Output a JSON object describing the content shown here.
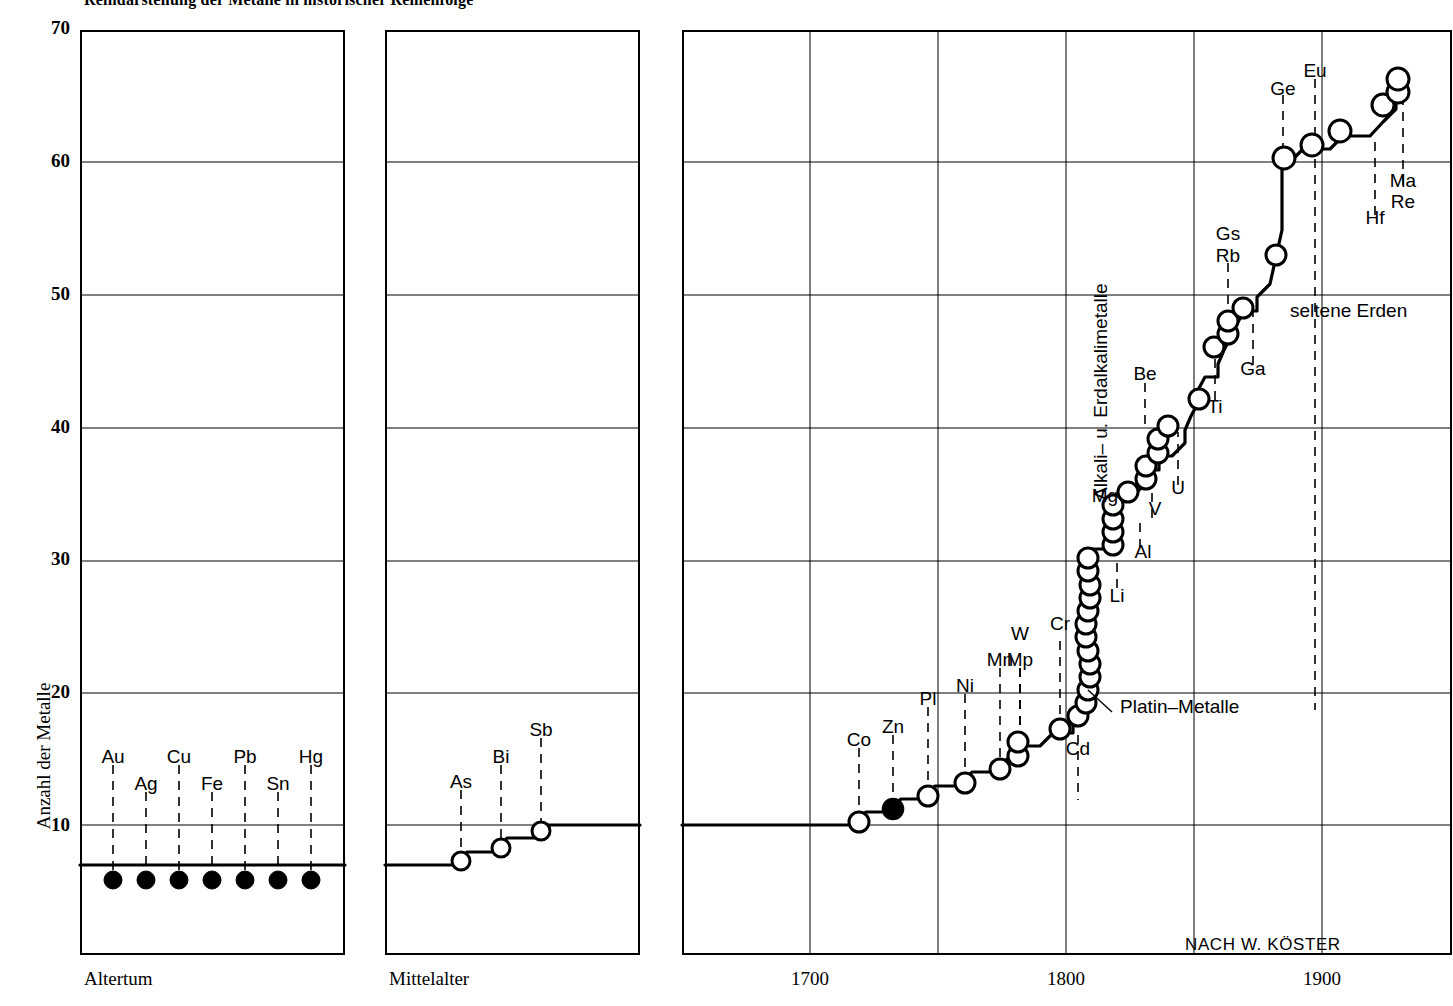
{
  "title": "Reihdarstellung der Metalle in historischer Reihenfolge",
  "credit": "NACH  W. KÖSTER",
  "axes": {
    "y_label": "Anzahl der Metalle",
    "y_ticks": [
      10,
      20,
      30,
      40,
      50,
      60,
      70
    ],
    "y_min": 0,
    "y_max": 70,
    "panel_labels": [
      "Altertum",
      "Mittelalter"
    ],
    "x_ticks": [
      1700,
      1800,
      1900
    ]
  },
  "annotations": {
    "platin": "Platin–Metalle",
    "alkali": "Alkali– u.  Erdalkalimetalle",
    "seltene": "seltene Erden"
  },
  "chart_data": {
    "type": "line",
    "title": "Reihdarstellung der Metalle in historischer Reihenfolge",
    "xlabel": "",
    "ylabel": "Anzahl der Metalle",
    "ylim": [
      0,
      70
    ],
    "grid": true,
    "legend": "none",
    "panels": [
      {
        "name": "Altertum",
        "baseline_level": 7,
        "marker": "filled",
        "points": [
          {
            "label": "Au",
            "value": 7
          },
          {
            "label": "Ag",
            "value": 7
          },
          {
            "label": "Cu",
            "value": 7
          },
          {
            "label": "Fe",
            "value": 7
          },
          {
            "label": "Pb",
            "value": 7
          },
          {
            "label": "Sn",
            "value": 7
          },
          {
            "label": "Hg",
            "value": 7
          }
        ]
      },
      {
        "name": "Mittelalter",
        "baseline_level": 7,
        "marker": "open",
        "points": [
          {
            "label": "As",
            "value": 8
          },
          {
            "label": "Bi",
            "value": 9
          },
          {
            "label": "Sb",
            "value": 10
          }
        ]
      },
      {
        "name": "Neuzeit",
        "xlim": [
          1650,
          1940
        ],
        "marker": "open",
        "points": [
          {
            "label": "Co",
            "year": 1735,
            "value": 10
          },
          {
            "label": "Zn",
            "year": 1746,
            "value": 11
          },
          {
            "label": "Pl",
            "year": 1751,
            "value": 12
          },
          {
            "label": "Ni",
            "year": 1760,
            "value": 13
          },
          {
            "label": "Mn",
            "year": 1774,
            "value": 14
          },
          {
            "label": "Mp",
            "year": 1781,
            "value": 15
          },
          {
            "label": "W",
            "year": 1783,
            "value": 16
          },
          {
            "label": "Cr",
            "year": 1797,
            "value": 17
          },
          {
            "label": "Cd",
            "year": 1802,
            "value": 18
          },
          {
            "label": "Platin-Metalle",
            "year": 1804,
            "value": 19
          },
          {
            "label": "",
            "year": 1804,
            "value": 20
          },
          {
            "label": "",
            "year": 1805,
            "value": 21
          },
          {
            "label": "",
            "year": 1805,
            "value": 22
          },
          {
            "label": "",
            "year": 1806,
            "value": 23
          },
          {
            "label": "",
            "year": 1806,
            "value": 24
          },
          {
            "label": "",
            "year": 1807,
            "value": 25
          },
          {
            "label": "",
            "year": 1807,
            "value": 26
          },
          {
            "label": "",
            "year": 1808,
            "value": 27
          },
          {
            "label": "",
            "year": 1808,
            "value": 28
          },
          {
            "label": "",
            "year": 1808,
            "value": 29
          },
          {
            "label": "",
            "year": 1808,
            "value": 30
          },
          {
            "label": "Li",
            "year": 1810,
            "value": 31
          },
          {
            "label": "Mg",
            "year": 1812,
            "value": 32
          },
          {
            "label": "Al",
            "year": 1813,
            "value": 33
          },
          {
            "label": "",
            "year": 1814,
            "value": 34
          },
          {
            "label": "",
            "year": 1817,
            "value": 35
          },
          {
            "label": "V",
            "year": 1822,
            "value": 36
          },
          {
            "label": "",
            "year": 1824,
            "value": 37
          },
          {
            "label": "Be",
            "year": 1826,
            "value": 38
          },
          {
            "label": "",
            "year": 1828,
            "value": 39
          },
          {
            "label": "U",
            "year": 1841,
            "value": 40
          },
          {
            "label": "Ti",
            "year": 1857,
            "value": 45
          },
          {
            "label": "",
            "year": 1860,
            "value": 46
          },
          {
            "label": "",
            "year": 1861,
            "value": 47
          },
          {
            "label": "Rb",
            "year": 1863,
            "value": 48
          },
          {
            "label": "Gs",
            "year": 1863,
            "value": 49
          },
          {
            "label": "Ga",
            "year": 1875,
            "value": 50
          },
          {
            "label": "Ge",
            "year": 1886,
            "value": 60
          },
          {
            "label": "",
            "year": 1895,
            "value": 61
          },
          {
            "label": "Eu",
            "year": 1901,
            "value": 62
          },
          {
            "label": "Hf",
            "year": 1923,
            "value": 64
          },
          {
            "label": "Ma",
            "year": 1925,
            "value": 65
          },
          {
            "label": "Re",
            "year": 1925,
            "value": 66
          }
        ],
        "element_labels": [
          "Co",
          "Zn",
          "Pl",
          "Ni",
          "Mn",
          "Mp",
          "W",
          "Cr",
          "Cd",
          "Li",
          "Mg",
          "Al",
          "V",
          "Be",
          "U",
          "Ti",
          "Ga",
          "Rb",
          "Gs",
          "Ge",
          "Eu",
          "Hf",
          "Ma",
          "Re"
        ]
      }
    ]
  }
}
